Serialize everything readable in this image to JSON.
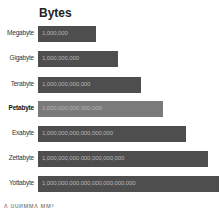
{
  "chart_data": {
    "type": "bar",
    "orientation": "horizontal",
    "title": "Bytes",
    "categories": [
      "Megabyte",
      "Gigabyte",
      "Terabyte",
      "Petabyte",
      "Exabyte",
      "Zettabyte",
      "Yottabyte"
    ],
    "values": [
      1000000,
      1000000000,
      1000000000000,
      1000000000000000,
      1000000000000000000,
      1000000000000000000000,
      1000000000000000000000000
    ],
    "value_labels": [
      "1,000,000",
      "1,000,000,000",
      "1,000,000,000,000",
      "1,000,000,000,000,000",
      "1,000,000,000,000,000,000",
      "1,000,000,000,000,000,000,000",
      "1,000,000,000,000,000,000,000,000"
    ],
    "scale": "logarithmic (bar length grows linearly with exponent)",
    "highlighted": "Petabyte",
    "xlabel": "",
    "ylabel": "",
    "grid": false,
    "legend": null
  },
  "rows": [
    {
      "label": "Megabyte",
      "value": "1,000,000",
      "top": 26,
      "width": 58
    },
    {
      "label": "Gigabyte",
      "value": "1,000,000,000",
      "top": 51,
      "width": 80
    },
    {
      "label": "Terabyte",
      "value": "1,000,000,000,000",
      "top": 77,
      "width": 103
    },
    {
      "label": "Petabyte",
      "value": "1,000,000,000,000,000",
      "top": 101,
      "width": 125
    },
    {
      "label": "Exabyte",
      "value": "1,000,000,000,000,000,000",
      "top": 126,
      "width": 148
    },
    {
      "label": "Zettabyte",
      "value": "1,000,000,000,000,000,000,000",
      "top": 151,
      "width": 170
    },
    {
      "label": "Yottabyte",
      "value": "1,000,000,000,000,000,000,000,000",
      "top": 176,
      "width": 181
    }
  ],
  "footer": {
    "text": "ᴧ ᴜᴜᴎᴍᴍᴧ ᴍᴍ³"
  }
}
